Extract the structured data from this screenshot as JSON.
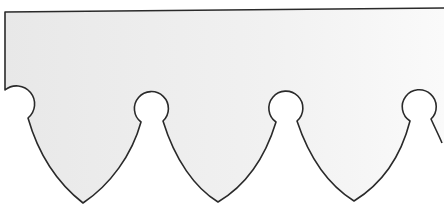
{
  "figure": {
    "colors": {
      "background": "#ffffff",
      "fill": "#ececec",
      "fill_light": "#f6f6f6",
      "stroke": "#2a2a2a"
    },
    "lobe_count": 3,
    "cutout_count": 4
  }
}
